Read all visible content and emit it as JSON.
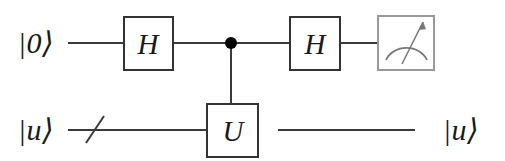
{
  "diagram": {
    "type": "quantum-circuit",
    "background_color": "#ffffff",
    "wire_color": "#3a3a3a",
    "gate_border_color": "#333333",
    "meter_border_color": "#999999",
    "meter_symbol_color": "#777777",
    "control_dot_color": "#000000",
    "text_color": "#1a1a1a"
  },
  "wires": {
    "top": {
      "name": "control-qubit-wire",
      "input_label": "|0⟩",
      "y": 43
    },
    "bottom": {
      "name": "target-register-wire",
      "input_label": "|u⟩",
      "output_label": "|u⟩",
      "y": 130,
      "bundle_slash": true
    }
  },
  "gates": [
    {
      "id": "hadamard-1",
      "label": "H",
      "kind": "box",
      "wire": "top",
      "x": 124,
      "y": 17,
      "width": 49,
      "height": 53
    },
    {
      "id": "control-dot",
      "label": "",
      "kind": "control",
      "wire": "top",
      "x": 231,
      "y": 43,
      "radius": 6
    },
    {
      "id": "u-gate",
      "label": "U",
      "kind": "box",
      "wire": "bottom",
      "x": 207,
      "y": 104,
      "width": 51,
      "height": 53
    },
    {
      "id": "hadamard-2",
      "label": "H",
      "kind": "box",
      "wire": "top",
      "x": 290,
      "y": 17,
      "width": 50,
      "height": 53
    },
    {
      "id": "measurement",
      "label": "",
      "kind": "meter",
      "wire": "top",
      "x": 378,
      "y": 16,
      "width": 56,
      "height": 54
    }
  ],
  "labels": {
    "top_input": {
      "text": "|0⟩",
      "x": 36,
      "y": 43
    },
    "bottom_input": {
      "text": "|u⟩",
      "x": 36,
      "y": 130
    },
    "bottom_output": {
      "text": "|u⟩",
      "x": 461,
      "y": 130
    },
    "hadamard_1": {
      "text": "H",
      "x": 148,
      "y": 44
    },
    "hadamard_2": {
      "text": "H",
      "x": 315,
      "y": 44
    },
    "u_gate": {
      "text": "U",
      "x": 233,
      "y": 131
    }
  }
}
